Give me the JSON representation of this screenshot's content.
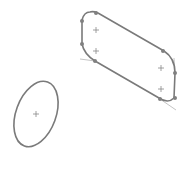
{
  "canvas": {
    "width": 190,
    "height": 172,
    "background": "#ffffff"
  },
  "colors": {
    "stroke": "#7a7a7a",
    "construction": "#b5b5b5",
    "point": "#808080",
    "marker": "#888888"
  },
  "sketch": {
    "slot": {
      "path": "M90 12 Q84 12 82 20 L82 44 Q84 54 95 61 L159 98 Q168 104 174 98 L175 73 Q175 58 164 51 L98 13 Q93 11 90 12 Z",
      "points": [
        [
          96,
          13
        ],
        [
          82,
          21
        ],
        [
          82,
          44
        ],
        [
          95,
          61
        ],
        [
          163,
          51
        ],
        [
          175,
          73
        ],
        [
          175,
          98
        ],
        [
          160,
          99
        ]
      ],
      "centers": [
        [
          96,
          30
        ],
        [
          96,
          51
        ],
        [
          161,
          68
        ],
        [
          161,
          89
        ]
      ],
      "construction_lines": [
        [
          [
            80,
            59
          ],
          [
            95,
            61
          ]
        ],
        [
          [
            174,
            58
          ],
          [
            175,
            73
          ]
        ],
        [
          [
            160,
            99
          ],
          [
            176,
            110
          ]
        ]
      ]
    },
    "ellipse": {
      "cx": 36,
      "cy": 114,
      "rx": 20,
      "ry": 34,
      "rotation": 20,
      "center_marker": [
        36,
        114
      ]
    }
  }
}
